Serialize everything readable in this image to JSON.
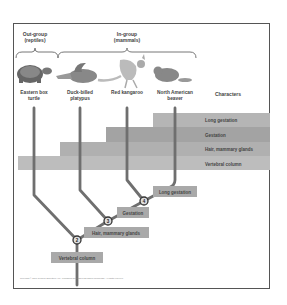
{
  "figure": {
    "outgroup": {
      "title": "Out-group",
      "subtitle": "(reptiles)"
    },
    "ingroup": {
      "title": "In-group",
      "subtitle": "(mammals)"
    },
    "taxa": [
      {
        "name_line1": "Eastern box",
        "name_line2": "turtle",
        "icon": "turtle-icon"
      },
      {
        "name_line1": "Duck-billed",
        "name_line2": "platypus",
        "icon": "platypus-icon"
      },
      {
        "name_line1": "Red kangaroo",
        "name_line2": "",
        "icon": "kangaroo-icon"
      },
      {
        "name_line1": "North American",
        "name_line2": "beaver",
        "icon": "beaver-icon"
      }
    ],
    "characters_header": "Characters",
    "character_bars": [
      {
        "label": "Long gestation"
      },
      {
        "label": "Gestation"
      },
      {
        "label": "Hair, mammary glands"
      },
      {
        "label": "Vertebral column"
      }
    ],
    "nodes": [
      {
        "number": "1",
        "label": "Vertebral column"
      },
      {
        "number": "2",
        "label": "Hair, mammary glands"
      },
      {
        "number": "3",
        "label": "Gestation"
      },
      {
        "number": "4",
        "label": "Long gestation"
      }
    ],
    "copyright": "Copyright © 2007 Pearson Education, Inc., publishing as Pearson Benjamin Cummings. All rights reserved."
  }
}
